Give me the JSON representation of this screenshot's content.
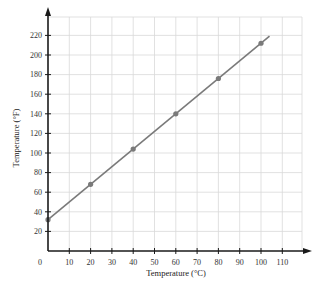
{
  "chart_data": {
    "type": "line",
    "title": "",
    "xlabel": "Temperature (°C)",
    "ylabel": "Temperature (°F)",
    "x": [
      0,
      20,
      40,
      60,
      80,
      100
    ],
    "series": [
      {
        "name": "°F vs °C",
        "values": [
          32,
          68,
          104,
          140,
          176,
          212
        ],
        "color": "#7a7a7a"
      }
    ],
    "line_extent": {
      "x_start": 0,
      "x_end": 104,
      "y_start": 32,
      "y_end": 219.2
    },
    "xlim": [
      0,
      120
    ],
    "ylim": [
      0,
      240
    ],
    "x_ticks": [
      "0",
      "10",
      "20",
      "30",
      "40",
      "50",
      "60",
      "70",
      "80",
      "90",
      "100",
      "110"
    ],
    "y_ticks": [
      "20",
      "40",
      "60",
      "80",
      "100",
      "120",
      "140",
      "160",
      "180",
      "200",
      "220"
    ],
    "grid": true,
    "legend": "none"
  },
  "colors": {
    "axis": "#1a1a1a",
    "grid": "#d9d9d9",
    "line": "#7a7a7a",
    "marker": "#7a7a7a"
  }
}
